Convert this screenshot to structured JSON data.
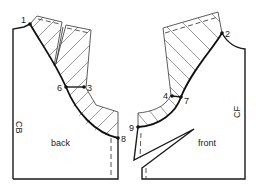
{
  "diagram": {
    "type": "pattern-drafting",
    "pieces": [
      {
        "name": "back",
        "label": "back",
        "edge_label": "CB"
      },
      {
        "name": "front",
        "label": "front",
        "edge_label": "CF"
      }
    ],
    "points": [
      {
        "id": "1",
        "label": "1"
      },
      {
        "id": "2",
        "label": "2"
      },
      {
        "id": "3",
        "label": "3"
      },
      {
        "id": "4",
        "label": "4"
      },
      {
        "id": "6",
        "label": "6"
      },
      {
        "id": "7",
        "label": "7"
      },
      {
        "id": "8",
        "label": "8"
      },
      {
        "id": "9",
        "label": "9"
      }
    ]
  },
  "back": {
    "label": "back",
    "cb": "CB"
  },
  "front": {
    "label": "front",
    "cf": "CF"
  },
  "points": {
    "p1": "1",
    "p2": "2",
    "p3": "3",
    "p4": "4",
    "p6": "6",
    "p7": "7",
    "p8": "8",
    "p9": "9"
  }
}
